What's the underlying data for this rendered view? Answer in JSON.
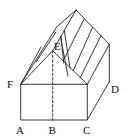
{
  "diagram": {
    "type": "geometry-solid",
    "labels": {
      "A": "A",
      "B": "B",
      "C": "C",
      "D": "D",
      "E": "E",
      "F": "F"
    },
    "colors": {
      "stroke": "#222222",
      "text": "#111111",
      "background": "#ffffff"
    }
  }
}
